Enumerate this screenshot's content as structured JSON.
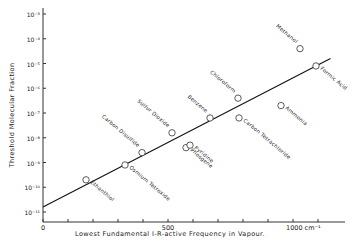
{
  "chart_data": {
    "type": "scatter",
    "title": "",
    "xlabel": "Lowest Fundamental I-R-active Frequency in Vapour.",
    "ylabel": "Threshold Molecular Fraction",
    "x_unit": "cm⁻¹",
    "xlim": [
      0,
      1150
    ],
    "ylim_log10": [
      -11,
      -3
    ],
    "y_scale": "log",
    "grid": false,
    "x_ticks": [
      0,
      100,
      200,
      300,
      400,
      500,
      600,
      700,
      800,
      900,
      1000,
      1100
    ],
    "x_tick_labels": [
      {
        "value": 0,
        "label": "0"
      },
      {
        "value": 500,
        "label": "500"
      },
      {
        "value": 1000,
        "label": "1000 cm⁻¹"
      }
    ],
    "y_tick_labels": [
      "10⁻³",
      "10⁻⁴",
      "10⁻⁵",
      "10⁻⁶",
      "10⁻⁷",
      "10⁻⁸",
      "10⁻⁹",
      "10⁻¹⁰",
      "10⁻¹¹"
    ],
    "y_tick_exponents": [
      -3,
      -4,
      -5,
      -6,
      -7,
      -8,
      -9,
      -10,
      -11
    ],
    "points": [
      {
        "label": "Ethanthiol",
        "x": 172,
        "log10_y": -9.7,
        "label_side": "below"
      },
      {
        "label": "Osmium Tetroxide",
        "x": 328,
        "log10_y": -9.1,
        "label_side": "below"
      },
      {
        "label": "Carbon Disulfide",
        "x": 396,
        "log10_y": -8.6,
        "label_side": "above"
      },
      {
        "label": "Sulfur Dioxide",
        "x": 516,
        "log10_y": -7.8,
        "label_side": "above"
      },
      {
        "label": "Phosgene",
        "x": 572,
        "log10_y": -8.4,
        "label_side": "below"
      },
      {
        "label": "Pyridine",
        "x": 588,
        "log10_y": -8.3,
        "label_side": "below"
      },
      {
        "label": "Benzene",
        "x": 668,
        "log10_y": -7.2,
        "label_side": "above"
      },
      {
        "label": "Chloroform",
        "x": 780,
        "log10_y": -6.4,
        "label_side": "above"
      },
      {
        "label": "Carbon Tetrachloride",
        "x": 784,
        "log10_y": -7.2,
        "label_side": "below"
      },
      {
        "label": "Ammonia",
        "x": 952,
        "log10_y": -6.7,
        "label_side": "below"
      },
      {
        "label": "Methanol",
        "x": 1028,
        "log10_y": -4.4,
        "label_side": "above"
      },
      {
        "label": "Formic Acid",
        "x": 1092,
        "log10_y": -5.1,
        "label_side": "below"
      }
    ],
    "fit_line": {
      "x": [
        0,
        1150
      ],
      "log10_y": [
        -10.8,
        -4.8
      ]
    }
  }
}
